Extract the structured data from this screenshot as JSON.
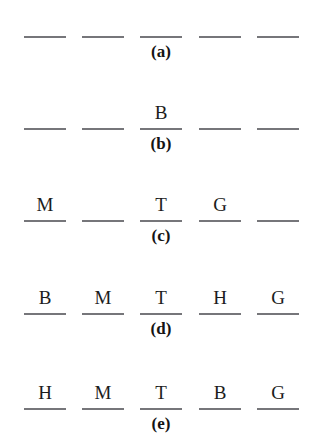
{
  "figure": {
    "background_color": "#ffffff",
    "rule_color": "#76767a",
    "letter_color": "#1c1c1c",
    "label_color": "#141414",
    "slot_x_positions": [
      24,
      82,
      140,
      199,
      257
    ],
    "rows": [
      {
        "label": "(a)",
        "top": 8,
        "slots": [
          "",
          "",
          "",
          "",
          ""
        ]
      },
      {
        "label": "(b)",
        "top": 100,
        "slots": [
          "",
          "",
          "B",
          "",
          ""
        ]
      },
      {
        "label": "(c)",
        "top": 192,
        "slots": [
          "M",
          "",
          "T",
          "G",
          ""
        ]
      },
      {
        "label": "(d)",
        "top": 285,
        "slots": [
          "B",
          "M",
          "T",
          "H",
          "G"
        ]
      },
      {
        "label": "(e)",
        "top": 380,
        "slots": [
          "H",
          "M",
          "T",
          "B",
          "G"
        ]
      }
    ]
  }
}
